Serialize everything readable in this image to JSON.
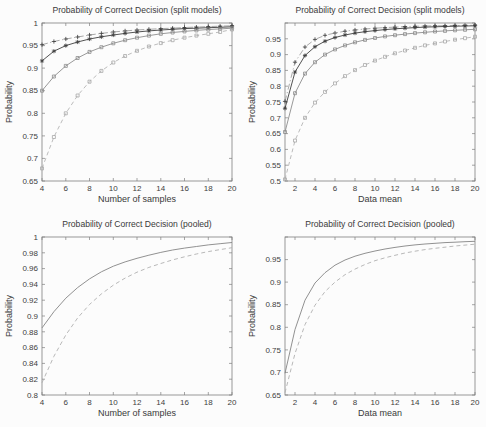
{
  "page": {
    "width": 486,
    "height": 427,
    "background": "#fcfcfc"
  },
  "chart_data": [
    {
      "id": "top-left",
      "type": "line",
      "title": "Probability of Correct Decision (split models)",
      "xlabel": "Number of samples",
      "ylabel": "Probability",
      "xlim": [
        4,
        20
      ],
      "ylim": [
        0.65,
        1.0
      ],
      "grid": false,
      "legend": "none",
      "xticks": [
        4,
        6,
        8,
        10,
        12,
        14,
        16,
        18,
        20
      ],
      "xtick_labels": [
        "4",
        "6",
        "8",
        "10",
        "12",
        "14",
        "16",
        "18",
        "20"
      ],
      "yticks": [
        0.65,
        0.7,
        0.75,
        0.8,
        0.85,
        0.9,
        0.95,
        1.0
      ],
      "ytick_labels": [
        "0.65",
        "0.7",
        "0.75",
        "0.8",
        "0.85",
        "0.9",
        "0.95",
        "1"
      ],
      "series": [
        {
          "name": "dashdot-plus-markers",
          "linestyle": "dashdot",
          "marker": "plus",
          "color": "#9e9e9e",
          "marker_color": "#3a3a3a",
          "x": [
            4,
            5,
            6,
            7,
            8,
            9,
            10,
            11,
            12,
            13,
            14,
            15,
            16,
            17,
            18,
            19,
            20
          ],
          "y": [
            0.952,
            0.959,
            0.9645,
            0.969,
            0.9735,
            0.977,
            0.98,
            0.9825,
            0.9845,
            0.986,
            0.9875,
            0.9885,
            0.99,
            0.991,
            0.992,
            0.993,
            0.994
          ]
        },
        {
          "name": "solid-star-markers",
          "linestyle": "solid",
          "marker": "star",
          "color": "#3f3f3f",
          "marker_color": "#3f3f3f",
          "x": [
            4,
            5,
            6,
            7,
            8,
            9,
            10,
            11,
            12,
            13,
            14,
            15,
            16,
            17,
            18,
            19,
            20
          ],
          "y": [
            0.916,
            0.9375,
            0.95,
            0.958,
            0.9645,
            0.9695,
            0.9735,
            0.977,
            0.98,
            0.9825,
            0.9845,
            0.986,
            0.9875,
            0.9885,
            0.9895,
            0.9905,
            0.9915
          ]
        },
        {
          "name": "solid-square-markers",
          "linestyle": "solid",
          "marker": "square",
          "color": "#8d8d8d",
          "marker_color": "#8d8d8d",
          "x": [
            4,
            5,
            6,
            7,
            8,
            9,
            10,
            11,
            12,
            13,
            14,
            15,
            16,
            17,
            18,
            19,
            20
          ],
          "y": [
            0.85,
            0.8815,
            0.905,
            0.9225,
            0.936,
            0.9465,
            0.955,
            0.962,
            0.9675,
            0.972,
            0.976,
            0.979,
            0.9815,
            0.9835,
            0.9855,
            0.987,
            0.9885
          ]
        },
        {
          "name": "dashed-square-markers",
          "linestyle": "dashed",
          "marker": "square",
          "color": "#b4b4b4",
          "marker_color": "#a8a8a8",
          "x": [
            4,
            5,
            6,
            7,
            8,
            9,
            10,
            11,
            12,
            13,
            14,
            15,
            16,
            17,
            18,
            19,
            20
          ],
          "y": [
            0.678,
            0.7475,
            0.8,
            0.8395,
            0.87,
            0.894,
            0.9125,
            0.927,
            0.9385,
            0.948,
            0.9555,
            0.962,
            0.9675,
            0.972,
            0.976,
            0.98,
            0.9855
          ]
        }
      ]
    },
    {
      "id": "top-right",
      "type": "line",
      "title": "Probability of Correct Decision (split models)",
      "xlabel": "Data mean",
      "ylabel": "Probability",
      "xlim": [
        1,
        20
      ],
      "ylim": [
        0.5,
        1.0
      ],
      "grid": false,
      "legend": "none",
      "xticks": [
        2,
        4,
        6,
        8,
        10,
        12,
        14,
        16,
        18,
        20
      ],
      "xtick_labels": [
        "2",
        "4",
        "6",
        "8",
        "10",
        "12",
        "14",
        "16",
        "18",
        "20"
      ],
      "yticks": [
        0.5,
        0.55,
        0.6,
        0.65,
        0.7,
        0.75,
        0.8,
        0.85,
        0.9,
        0.95,
        1.0
      ],
      "ytick_labels": [
        "0.5",
        "0.55",
        "0.6",
        "0.65",
        "0.7",
        "0.75",
        "0.8",
        "0.85",
        "0.9",
        "0.95",
        ""
      ],
      "series": [
        {
          "name": "dashdot-plus-markers",
          "linestyle": "dashdot",
          "marker": "plus",
          "color": "#9e9e9e",
          "marker_color": "#3a3a3a",
          "x": [
            1,
            2,
            3,
            4,
            5,
            6,
            7,
            8,
            9,
            10,
            11,
            12,
            13,
            14,
            15,
            16,
            17,
            18,
            19,
            20
          ],
          "y": [
            0.752,
            0.876,
            0.924,
            0.948,
            0.961,
            0.9685,
            0.974,
            0.978,
            0.981,
            0.9835,
            0.9855,
            0.987,
            0.9885,
            0.9895,
            0.9905,
            0.991,
            0.9915,
            0.992,
            0.9925,
            0.993
          ]
        },
        {
          "name": "solid-star-markers",
          "linestyle": "solid",
          "marker": "star",
          "color": "#3f3f3f",
          "marker_color": "#3f3f3f",
          "x": [
            1,
            2,
            3,
            4,
            5,
            6,
            7,
            8,
            9,
            10,
            11,
            12,
            13,
            14,
            15,
            16,
            17,
            18,
            19,
            20
          ],
          "y": [
            0.73,
            0.845,
            0.897,
            0.925,
            0.9425,
            0.954,
            0.962,
            0.968,
            0.9725,
            0.976,
            0.979,
            0.9815,
            0.9835,
            0.9855,
            0.987,
            0.988,
            0.989,
            0.99,
            0.9905,
            0.991
          ]
        },
        {
          "name": "solid-square-markers",
          "linestyle": "solid",
          "marker": "square",
          "color": "#8d8d8d",
          "marker_color": "#8d8d8d",
          "x": [
            1,
            2,
            3,
            4,
            5,
            6,
            7,
            8,
            9,
            10,
            11,
            12,
            13,
            14,
            15,
            16,
            17,
            18,
            19,
            20
          ],
          "y": [
            0.655,
            0.778,
            0.84,
            0.876,
            0.9,
            0.9165,
            0.929,
            0.939,
            0.9465,
            0.9525,
            0.9575,
            0.9615,
            0.965,
            0.968,
            0.9705,
            0.973,
            0.975,
            0.977,
            0.9785,
            0.98
          ]
        },
        {
          "name": "dashed-square-markers",
          "linestyle": "dashed",
          "marker": "square",
          "color": "#b4b4b4",
          "marker_color": "#a8a8a8",
          "x": [
            1,
            2,
            3,
            4,
            5,
            6,
            7,
            8,
            9,
            10,
            11,
            12,
            13,
            14,
            15,
            16,
            17,
            18,
            19,
            20
          ],
          "y": [
            0.505,
            0.628,
            0.7,
            0.748,
            0.782,
            0.809,
            0.832,
            0.851,
            0.867,
            0.881,
            0.893,
            0.904,
            0.913,
            0.9215,
            0.929,
            0.9355,
            0.9415,
            0.947,
            0.952,
            0.9565
          ]
        }
      ]
    },
    {
      "id": "bottom-left",
      "type": "line",
      "title": "Probability of Correct Decision (pooled)",
      "xlabel": "Number of samples",
      "ylabel": "Probability",
      "xlim": [
        4,
        20
      ],
      "ylim": [
        0.8,
        1.0
      ],
      "grid": false,
      "legend": "none",
      "xticks": [
        4,
        6,
        8,
        10,
        12,
        14,
        16,
        18,
        20
      ],
      "xtick_labels": [
        "4",
        "6",
        "8",
        "10",
        "12",
        "14",
        "16",
        "18",
        "20"
      ],
      "yticks": [
        0.8,
        0.82,
        0.84,
        0.86,
        0.88,
        0.9,
        0.92,
        0.94,
        0.96,
        0.98,
        1.0
      ],
      "ytick_labels": [
        "0.8",
        "0.82",
        "0.84",
        "0.86",
        "0.88",
        "0.9",
        "0.92",
        "0.94",
        "0.96",
        "0.98",
        "1"
      ],
      "series": [
        {
          "name": "solid-line",
          "linestyle": "solid",
          "marker": "none",
          "color": "#858585",
          "marker_color": "#858585",
          "x": [
            4,
            5,
            6,
            7,
            8,
            9,
            10,
            11,
            12,
            13,
            14,
            15,
            16,
            17,
            18,
            19,
            20
          ],
          "y": [
            0.885,
            0.9055,
            0.9225,
            0.936,
            0.947,
            0.956,
            0.963,
            0.9685,
            0.973,
            0.977,
            0.9805,
            0.9835,
            0.986,
            0.988,
            0.99,
            0.9915,
            0.993
          ]
        },
        {
          "name": "dashed-line",
          "linestyle": "dashed",
          "marker": "none",
          "color": "#b0b0b0",
          "marker_color": "#b0b0b0",
          "x": [
            4,
            5,
            6,
            7,
            8,
            9,
            10,
            11,
            12,
            13,
            14,
            15,
            16,
            17,
            18,
            19,
            20
          ],
          "y": [
            0.8155,
            0.849,
            0.876,
            0.8975,
            0.9145,
            0.928,
            0.939,
            0.948,
            0.9555,
            0.9615,
            0.9665,
            0.971,
            0.975,
            0.9785,
            0.9815,
            0.984,
            0.9865
          ]
        }
      ]
    },
    {
      "id": "bottom-right",
      "type": "line",
      "title": "Probability of Correct Decision (pooled)",
      "xlabel": "Data mean",
      "ylabel": "Probability",
      "xlim": [
        1,
        20
      ],
      "ylim": [
        0.65,
        1.0
      ],
      "grid": false,
      "legend": "none",
      "xticks": [
        2,
        4,
        6,
        8,
        10,
        12,
        14,
        16,
        18,
        20
      ],
      "xtick_labels": [
        "2",
        "4",
        "6",
        "8",
        "10",
        "12",
        "14",
        "16",
        "18",
        "20"
      ],
      "yticks": [
        0.65,
        0.7,
        0.75,
        0.8,
        0.85,
        0.9,
        0.95,
        1.0
      ],
      "ytick_labels": [
        "0.65",
        "0.7",
        "0.75",
        "0.8",
        "0.85",
        "0.9",
        "0.95",
        ""
      ],
      "series": [
        {
          "name": "solid-line",
          "linestyle": "solid",
          "marker": "none",
          "color": "#858585",
          "marker_color": "#858585",
          "x": [
            1,
            2,
            3,
            4,
            5,
            6,
            7,
            8,
            9,
            10,
            11,
            12,
            13,
            14,
            15,
            16,
            17,
            18,
            19,
            20
          ],
          "y": [
            0.698,
            0.795,
            0.86,
            0.898,
            0.921,
            0.9375,
            0.949,
            0.9575,
            0.964,
            0.969,
            0.9735,
            0.977,
            0.98,
            0.9825,
            0.9845,
            0.986,
            0.9875,
            0.9885,
            0.9895,
            0.9905
          ]
        },
        {
          "name": "dashed-line",
          "linestyle": "dashed",
          "marker": "none",
          "color": "#b0b0b0",
          "marker_color": "#b0b0b0",
          "x": [
            1,
            2,
            3,
            4,
            5,
            6,
            7,
            8,
            9,
            10,
            11,
            12,
            13,
            14,
            15,
            16,
            17,
            18,
            19,
            20
          ],
          "y": [
            0.655,
            0.742,
            0.806,
            0.849,
            0.879,
            0.9,
            0.9165,
            0.929,
            0.939,
            0.9475,
            0.954,
            0.9595,
            0.9645,
            0.9685,
            0.972,
            0.975,
            0.9775,
            0.98,
            0.982,
            0.984
          ]
        }
      ]
    }
  ]
}
